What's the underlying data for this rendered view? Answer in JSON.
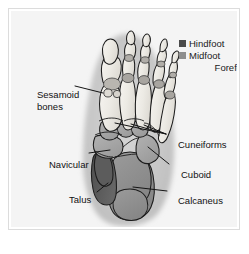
{
  "figure": {
    "background_color": "#f4f4f4",
    "frame_color": "#dcdcdc"
  },
  "legend": {
    "items": [
      {
        "label": "Hindfoot",
        "color": "#4a4a4a",
        "has_swatch": true
      },
      {
        "label": "Midfoot",
        "color": "#8e8e8e",
        "has_swatch": true
      },
      {
        "label": "Forefoot",
        "color": "#ffffff",
        "has_swatch": false
      }
    ]
  },
  "callouts": {
    "sesamoid_line1": "Sesamoid",
    "sesamoid_line2": "bones",
    "navicular": "Navicular",
    "talus": "Talus",
    "cuneiforms": "Cuneiforms",
    "cuboid": "Cuboid",
    "calcaneus": "Calcaneus"
  },
  "anatomy": {
    "soft_tissue_color": "#c9c9c9",
    "bone_fill": "#efede8",
    "bone_outline": "#1c1c1c",
    "hindfoot_talus_color": "#5a5a5a",
    "hindfoot_calcaneus_color": "#8e8e8e",
    "midfoot_color": "#a3a3a3",
    "joint_color": "#9a9a9a",
    "leader_line_color": "#141414"
  }
}
